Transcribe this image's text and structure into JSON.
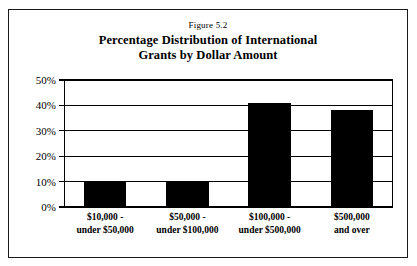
{
  "figure": {
    "number_label": "Figure 5.2",
    "title_line_1": "Percentage Distribution of International",
    "title_line_2": "Grants by Dollar Amount"
  },
  "chart_data": {
    "type": "bar",
    "title": "Percentage Distribution of International Grants by Dollar Amount",
    "subtitle": "Figure 5.2",
    "xlabel": "",
    "ylabel": "",
    "categories": [
      "$10,000 - under $50,000",
      "$50,000 - under $100,000",
      "$100,000 - under $500,000",
      "$500,000 and over"
    ],
    "category_lines": [
      [
        "$10,000 -",
        "under $50,000"
      ],
      [
        "$50,000 -",
        "under $100,000"
      ],
      [
        "$100,000 -",
        "under $500,000"
      ],
      [
        "$500,000",
        "and over"
      ]
    ],
    "values": [
      10,
      10,
      41,
      38
    ],
    "value_labels": [
      "10%",
      "10%",
      "41%",
      "38%"
    ],
    "ylim": [
      0,
      50
    ],
    "ytick_values": [
      0,
      10,
      20,
      30,
      40,
      50
    ],
    "ytick_labels": [
      "0%",
      "10%",
      "20%",
      "30%",
      "40%",
      "50%"
    ],
    "grid": true,
    "grid_axis": "y",
    "legend": false,
    "bar_color": "#000000",
    "axis_color": "#000000",
    "background_color": "#FFFFFF"
  }
}
